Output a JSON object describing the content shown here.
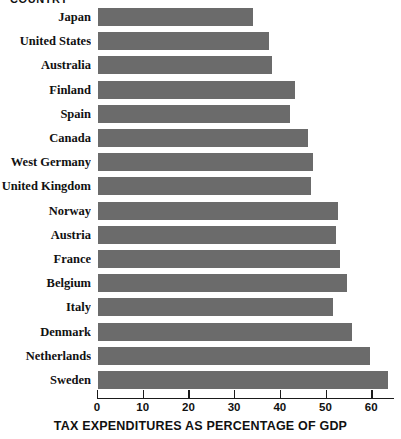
{
  "chart_data": {
    "type": "bar",
    "orientation": "horizontal",
    "title": "",
    "top_caption": "COUNTRY",
    "xlabel": "TAX EXPENDITURES AS PERCENTAGE OF GDP",
    "ylabel": "",
    "xlim": [
      0,
      65
    ],
    "xticks": [
      0,
      10,
      20,
      30,
      40,
      50,
      60
    ],
    "xtick_labels": [
      "0",
      "10",
      "20",
      "30",
      "40",
      "50",
      "60"
    ],
    "grid": false,
    "legend": null,
    "bar_color": "#6b6b6b",
    "axis_color": "#1a1a1a",
    "categories": [
      "Japan",
      "United States",
      "Australia",
      "Finland",
      "Spain",
      "Canada",
      "West Germany",
      "United Kingdom",
      "Norway",
      "Austria",
      "France",
      "Belgium",
      "Italy",
      "Denmark",
      "Netherlands",
      "Sweden"
    ],
    "values": [
      34,
      37.5,
      38,
      43,
      42,
      46,
      47,
      46.5,
      52.5,
      52,
      53,
      54.5,
      51.5,
      55.5,
      59.5,
      63.5
    ]
  }
}
